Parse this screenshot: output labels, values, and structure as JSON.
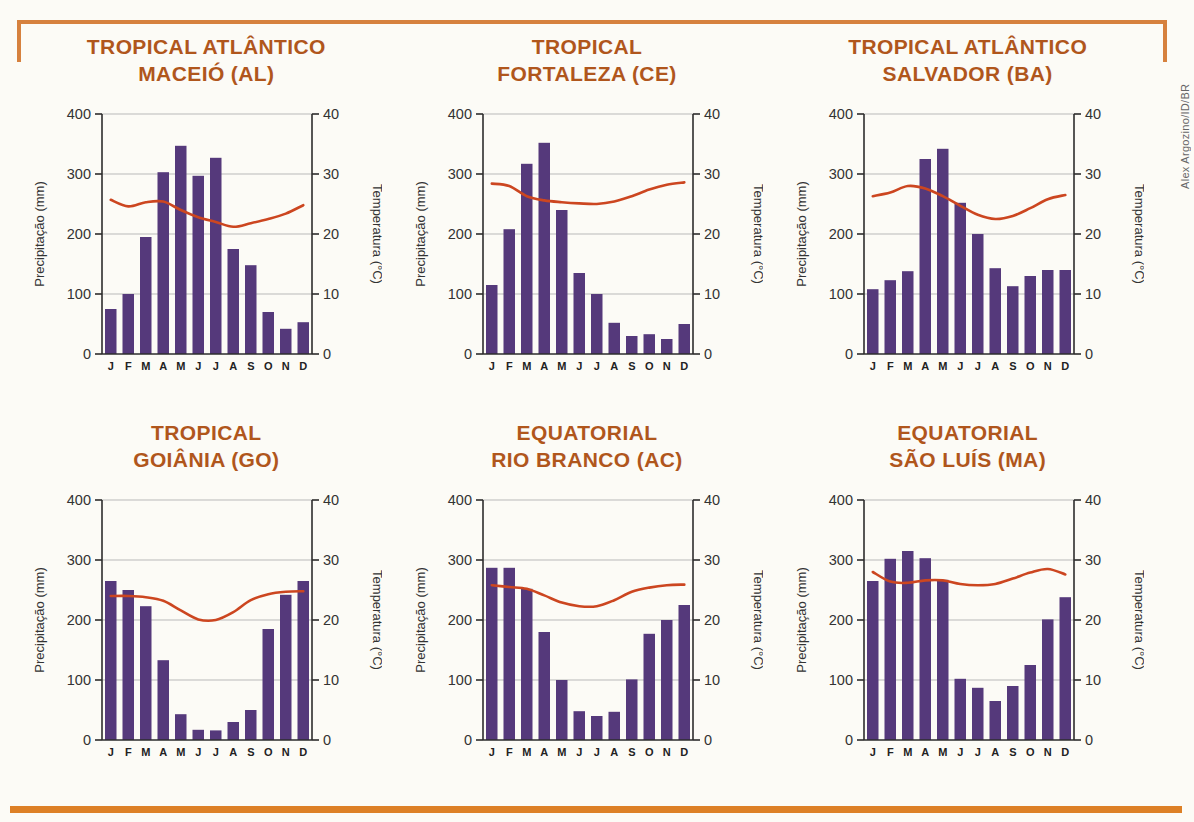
{
  "page": {
    "credit": "Alex Argozino/ID/BR",
    "colors": {
      "title": "#b0561c",
      "bar": "#55397b",
      "temp_line": "#cc4620",
      "grid": "#b9b9b9",
      "axis": "#2d2d2d",
      "tick_text": "#333333",
      "month_text": "#222222",
      "frame": "#d6813e",
      "bottom_bar": "#dd8026"
    }
  },
  "axes": {
    "left_label": "Precipitação (mm)",
    "right_label": "Temperatura (°C)",
    "left_ticks": [
      0,
      100,
      200,
      300,
      400
    ],
    "right_ticks": [
      0,
      10,
      20,
      30,
      40
    ],
    "months": [
      "J",
      "F",
      "M",
      "A",
      "M",
      "J",
      "J",
      "A",
      "S",
      "O",
      "N",
      "D"
    ]
  },
  "chart_data": [
    {
      "type": "bar+line",
      "title_line1": "TROPICAL ATLÂNTICO",
      "title_line2": "MACEIÓ (AL)",
      "categories": [
        "J",
        "F",
        "M",
        "A",
        "M",
        "J",
        "J",
        "A",
        "S",
        "O",
        "N",
        "D"
      ],
      "ylim_left": [
        0,
        400
      ],
      "ylim_right": [
        0,
        40
      ],
      "series": [
        {
          "name": "Precipitação (mm)",
          "type": "bar",
          "axis": "left",
          "values": [
            75,
            100,
            195,
            303,
            347,
            297,
            327,
            175,
            148,
            70,
            42,
            53
          ]
        },
        {
          "name": "Temperatura (°C)",
          "type": "line",
          "axis": "right",
          "values": [
            25.7,
            24.6,
            25.3,
            25.4,
            24.0,
            22.8,
            22.0,
            21.2,
            21.8,
            22.5,
            23.4,
            24.8
          ]
        }
      ]
    },
    {
      "type": "bar+line",
      "title_line1": "TROPICAL",
      "title_line2": "FORTALEZA (CE)",
      "categories": [
        "J",
        "F",
        "M",
        "A",
        "M",
        "J",
        "J",
        "A",
        "S",
        "O",
        "N",
        "D"
      ],
      "ylim_left": [
        0,
        400
      ],
      "ylim_right": [
        0,
        40
      ],
      "series": [
        {
          "name": "Precipitação (mm)",
          "type": "bar",
          "axis": "left",
          "values": [
            115,
            208,
            317,
            352,
            240,
            135,
            100,
            52,
            30,
            33,
            25,
            50
          ]
        },
        {
          "name": "Temperatura (°C)",
          "type": "line",
          "axis": "right",
          "values": [
            28.4,
            28.0,
            26.3,
            25.6,
            25.3,
            25.1,
            25.0,
            25.4,
            26.3,
            27.4,
            28.2,
            28.6
          ]
        }
      ]
    },
    {
      "type": "bar+line",
      "title_line1": "TROPICAL ATLÂNTICO",
      "title_line2": "SALVADOR (BA)",
      "categories": [
        "J",
        "F",
        "M",
        "A",
        "M",
        "J",
        "J",
        "A",
        "S",
        "O",
        "N",
        "D"
      ],
      "ylim_left": [
        0,
        400
      ],
      "ylim_right": [
        0,
        40
      ],
      "series": [
        {
          "name": "Precipitação (mm)",
          "type": "bar",
          "axis": "left",
          "values": [
            108,
            123,
            138,
            325,
            342,
            252,
            200,
            143,
            113,
            130,
            140,
            140
          ]
        },
        {
          "name": "Temperatura (°C)",
          "type": "line",
          "axis": "right",
          "values": [
            26.3,
            26.9,
            28.0,
            27.6,
            26.3,
            24.7,
            23.2,
            22.5,
            23.0,
            24.3,
            25.8,
            26.5
          ]
        }
      ]
    },
    {
      "type": "bar+line",
      "title_line1": "TROPICAL",
      "title_line2": "GOIÂNIA (GO)",
      "categories": [
        "J",
        "F",
        "M",
        "A",
        "M",
        "J",
        "J",
        "A",
        "S",
        "O",
        "N",
        "D"
      ],
      "ylim_left": [
        0,
        400
      ],
      "ylim_right": [
        0,
        40
      ],
      "series": [
        {
          "name": "Precipitação (mm)",
          "type": "bar",
          "axis": "left",
          "values": [
            265,
            250,
            223,
            133,
            43,
            17,
            16,
            30,
            50,
            185,
            242,
            265
          ]
        },
        {
          "name": "Temperatura (°C)",
          "type": "line",
          "axis": "right",
          "values": [
            24.0,
            24.0,
            23.8,
            23.2,
            21.6,
            20.1,
            20.0,
            21.3,
            23.3,
            24.3,
            24.7,
            24.8
          ]
        }
      ]
    },
    {
      "type": "bar+line",
      "title_line1": "EQUATORIAL",
      "title_line2": "RIO BRANCO (AC)",
      "categories": [
        "J",
        "F",
        "M",
        "A",
        "M",
        "J",
        "J",
        "A",
        "S",
        "O",
        "N",
        "D"
      ],
      "ylim_left": [
        0,
        400
      ],
      "ylim_right": [
        0,
        40
      ],
      "series": [
        {
          "name": "Precipitação (mm)",
          "type": "bar",
          "axis": "left",
          "values": [
            287,
            287,
            252,
            180,
            100,
            48,
            40,
            47,
            101,
            177,
            200,
            225
          ]
        },
        {
          "name": "Temperatura (°C)",
          "type": "line",
          "axis": "right",
          "values": [
            25.8,
            25.5,
            25.2,
            24.1,
            22.9,
            22.3,
            22.3,
            23.3,
            24.7,
            25.4,
            25.8,
            25.9
          ]
        }
      ]
    },
    {
      "type": "bar+line",
      "title_line1": "EQUATORIAL",
      "title_line2": "SÃO LUÍS (MA)",
      "categories": [
        "J",
        "F",
        "M",
        "A",
        "M",
        "J",
        "J",
        "A",
        "S",
        "O",
        "N",
        "D"
      ],
      "ylim_left": [
        0,
        400
      ],
      "ylim_right": [
        0,
        40
      ],
      "series": [
        {
          "name": "Precipitação (mm)",
          "type": "bar",
          "axis": "left",
          "values": [
            265,
            302,
            315,
            303,
            267,
            102,
            87,
            65,
            90,
            125,
            201,
            238
          ]
        },
        {
          "name": "Temperatura (°C)",
          "type": "line",
          "axis": "right",
          "values": [
            28.0,
            26.4,
            26.2,
            26.6,
            26.6,
            26.0,
            25.8,
            26.0,
            26.9,
            27.9,
            28.5,
            27.6
          ]
        }
      ]
    }
  ]
}
